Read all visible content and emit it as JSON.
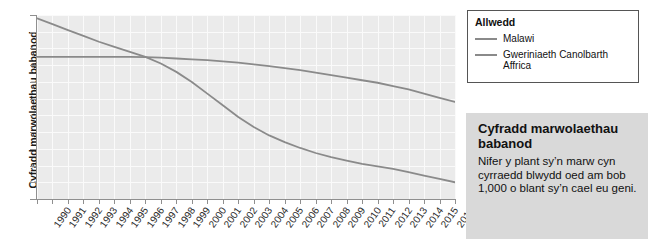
{
  "chart_data": {
    "type": "line",
    "title": "",
    "xlabel": "",
    "ylabel": "Cyfradd marwolaethau babanod",
    "xlim": [
      1990,
      2017
    ],
    "ylim": [
      30,
      140
    ],
    "grid": true,
    "legend_position": "outside-right-top",
    "categories": [
      1990,
      1991,
      1992,
      1993,
      1994,
      1995,
      1996,
      1997,
      1998,
      1999,
      2000,
      2001,
      2002,
      2003,
      2004,
      2005,
      2006,
      2007,
      2008,
      2009,
      2010,
      2011,
      2012,
      2013,
      2014,
      2015,
      2016,
      2017
    ],
    "yticks": [
      30,
      40,
      50,
      60,
      70,
      80,
      90,
      100,
      110,
      120,
      130,
      140
    ],
    "xticks": [
      "1990",
      "1991",
      "1992",
      "1993",
      "1994",
      "1995",
      "1996",
      "1997",
      "1998",
      "1999",
      "2000",
      "2001",
      "2002",
      "2003",
      "2004",
      "2005",
      "2006",
      "2007",
      "2008",
      "2009",
      "2010",
      "2011",
      "2012",
      "2013",
      "2014",
      "2015",
      "2016",
      "2017"
    ],
    "series": [
      {
        "name": "Malawi",
        "color": "#8a8a8a",
        "values": [
          138,
          134.5,
          131,
          127.5,
          124,
          121,
          118,
          115,
          111,
          106,
          100,
          93,
          86,
          79,
          73,
          68,
          64,
          60.5,
          57.5,
          55,
          53,
          51,
          49.5,
          48,
          46,
          44,
          42,
          40
        ]
      },
      {
        "name": "Gweriniaeth Canolbarth Affrica",
        "color": "#8a8a8a",
        "values": [
          115,
          115,
          115,
          115,
          115,
          115,
          115,
          114.8,
          114.5,
          114,
          113.5,
          113,
          112.3,
          111.5,
          110.5,
          109.5,
          108.3,
          107,
          105.5,
          104,
          102.5,
          101,
          99.5,
          97.5,
          95.5,
          93,
          90.5,
          88
        ]
      }
    ]
  },
  "legend": {
    "title": "Allwedd",
    "entries": [
      {
        "label": "Malawi"
      },
      {
        "label": "Gweriniaeth Canolbarth Affrica"
      }
    ]
  },
  "infobox": {
    "title": "Cyfradd marwolaethau babanod",
    "body": "Nifer y plant sy’n marw cyn cyrraedd blwydd oed am bob 1,000 o blant sy’n cael eu geni."
  },
  "colors": {
    "plot_background": "#ebebeb",
    "gridline": "#fafafa",
    "axis": "#8f8f8f",
    "series": "#8a8a8a",
    "infobox_background": "#d9d9d9",
    "legend_border": "#555555"
  }
}
